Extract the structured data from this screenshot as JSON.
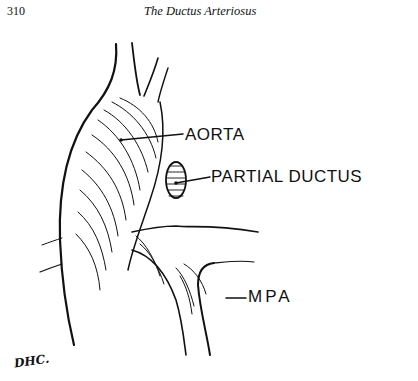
{
  "header": {
    "page_number": "310",
    "running_title": "The Ductus Arteriosus"
  },
  "figure": {
    "labels": {
      "aorta": "AORTA",
      "partial_ductus": "PARTIAL DUCTUS",
      "mpa": "MPA"
    },
    "signature": "DHC."
  }
}
